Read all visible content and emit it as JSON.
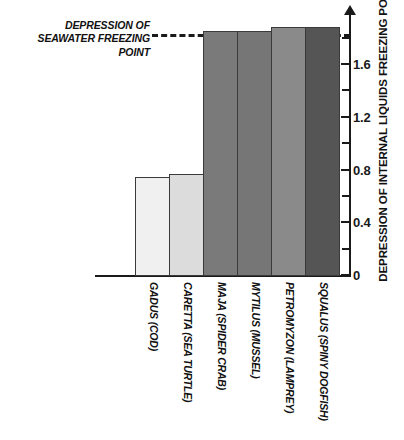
{
  "chart_data": {
    "type": "bar",
    "title": "",
    "xlabel": "",
    "ylabel": "DEPRESSION OF INTERNAL LIQUIDS FREEZING POINT",
    "ylim": [
      0,
      1.95
    ],
    "grid": false,
    "legend": null,
    "categories": [
      "GADUS (COD)",
      "CARETTA (SEA TURTLE)",
      "MAJA (SPIDER CRAB)",
      "MYTILUS (MUSSEL)",
      "PETROMYZON (LAMPREY)",
      "SQUALUS (SPINY DOGFISH)"
    ],
    "values": [
      0.75,
      0.77,
      1.85,
      1.85,
      1.88,
      1.88
    ],
    "bar_colors": [
      "#f0f0f0",
      "#dcdcdc",
      "#7a7a7a",
      "#767676",
      "#8a8a8a",
      "#555555"
    ],
    "tick_labels": [
      "0",
      "0.4",
      "0.8",
      "1.2",
      "1.6"
    ],
    "tick_values": [
      0,
      0.4,
      0.8,
      1.2,
      1.6
    ],
    "minor_tick_values": [
      0.2,
      0.6,
      1.0,
      1.4,
      1.8
    ],
    "annotations": [
      {
        "name": "seawater-freezing-point-threshold",
        "line1": "DEPRESSION OF",
        "line2": "SEAWATER FREEZING POINT",
        "value": 1.85,
        "style": "dashed"
      }
    ]
  },
  "axis": {
    "y_title": "DEPRESSION OF INTERNAL LIQUIDS FREEZING POINT"
  },
  "colors": {
    "axis": "#1a1a1a",
    "text": "#111111",
    "bar_border": "#3a3a3a"
  }
}
